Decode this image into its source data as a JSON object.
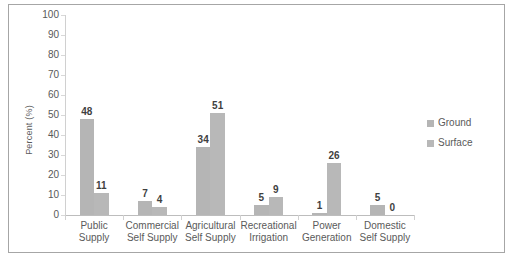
{
  "chart_data": {
    "type": "bar",
    "title": "",
    "xlabel": "",
    "ylabel": "Percent (%)",
    "ylim": [
      0,
      100
    ],
    "ytick_step": 10,
    "yticks": [
      "100",
      "90",
      "80",
      "70",
      "60",
      "50",
      "40",
      "30",
      "20",
      "10",
      "0"
    ],
    "grid": false,
    "legend_position": "right",
    "categories": [
      "Public\nSupply",
      "Commercial\nSelf Supply",
      "Agricultural\nSelf Supply",
      "Recreational\nIrrigation",
      "Power\nGeneration",
      "Domestic\nSelf Supply"
    ],
    "series": [
      {
        "name": "Ground",
        "color": "#b5b5b5",
        "values": [
          48,
          7,
          34,
          5,
          1,
          5
        ],
        "labels": [
          "48",
          "7",
          "34",
          "5",
          "1",
          "5"
        ]
      },
      {
        "name": "Surface",
        "color": "#b8b8b8",
        "values": [
          11,
          4,
          51,
          9,
          26,
          0
        ],
        "labels": [
          "11",
          "4",
          "51",
          "9",
          "26",
          "0"
        ]
      }
    ]
  },
  "legend": {
    "entries": [
      {
        "label": "Ground"
      },
      {
        "label": "Surface"
      }
    ]
  },
  "colors": {
    "frame_border": "#a6a6a6",
    "axis_line": "#bdbdbd",
    "tick_text": "#595959",
    "value_text": "#3f3f3f",
    "bar_ground": "#b5b5b5",
    "bar_surface": "#b8b8b8",
    "background": "#ffffff"
  }
}
